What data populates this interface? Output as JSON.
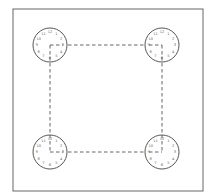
{
  "diagram": {
    "clocks": [
      {
        "id": "top-left",
        "numbers": [
          "12",
          "1",
          "2",
          "3",
          "4",
          "5",
          "6",
          "7",
          "8",
          "9",
          "10",
          "11"
        ],
        "hand": "right"
      },
      {
        "id": "top-right",
        "numbers": [
          "12",
          "1",
          "2",
          "3",
          "4",
          "5",
          "6",
          "7",
          "8",
          "9",
          "10",
          "11"
        ],
        "hand": "left"
      },
      {
        "id": "bottom-left",
        "numbers": [
          "12",
          "1",
          "2",
          "3",
          "4",
          "5",
          "6",
          "7",
          "8",
          "9",
          "10",
          "11"
        ],
        "hand": "right"
      },
      {
        "id": "bottom-right",
        "numbers": [
          "12",
          "1",
          "2",
          "3",
          "4",
          "5",
          "6",
          "7",
          "8",
          "9",
          "10",
          "11"
        ],
        "hand": "left"
      }
    ],
    "colors": {
      "stroke": "#444444",
      "frame": "#666666",
      "dash": "#555555"
    }
  }
}
